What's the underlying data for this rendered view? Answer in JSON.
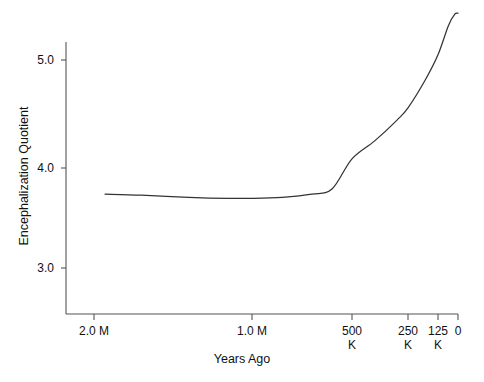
{
  "chart_data": {
    "type": "line",
    "title": "",
    "xlabel": "Years Ago",
    "ylabel": "Encephalization Quotient",
    "grid": false,
    "legend": "none",
    "x_axis": {
      "label": "Years Ago",
      "tick_labels": [
        "2.0 M",
        "1.0 M",
        "500\nK",
        "250\nK",
        "125\nK",
        "0"
      ],
      "tick_values_years_ago": [
        2000000,
        1000000,
        500000,
        250000,
        125000,
        0
      ],
      "tick_pixel_positions": [
        94,
        252,
        352,
        408,
        438,
        458
      ],
      "scale": "log-like (compressed toward present)",
      "direction": "decreasing left to right"
    },
    "y_axis": {
      "label": "Encephalization Quotient",
      "tick_labels": [
        "3.0",
        "4.0",
        "5.0"
      ],
      "tick_values": [
        3.0,
        4.0,
        5.0
      ],
      "ylim": [
        2.75,
        5.55
      ]
    },
    "series": [
      {
        "name": "Encephalization Quotient",
        "color": "#333333",
        "points": [
          {
            "years_ago": 1930000,
            "eq": 3.71
          },
          {
            "years_ago": 1700000,
            "eq": 3.7
          },
          {
            "years_ago": 1400000,
            "eq": 3.68
          },
          {
            "years_ago": 1150000,
            "eq": 3.67
          },
          {
            "years_ago": 1000000,
            "eq": 3.67
          },
          {
            "years_ago": 850000,
            "eq": 3.68
          },
          {
            "years_ago": 700000,
            "eq": 3.71
          },
          {
            "years_ago": 600000,
            "eq": 3.76
          },
          {
            "years_ago": 500000,
            "eq": 4.05
          },
          {
            "years_ago": 400000,
            "eq": 4.22
          },
          {
            "years_ago": 300000,
            "eq": 4.42
          },
          {
            "years_ago": 250000,
            "eq": 4.54
          },
          {
            "years_ago": 180000,
            "eq": 4.8
          },
          {
            "years_ago": 125000,
            "eq": 5.05
          },
          {
            "years_ago": 60000,
            "eq": 5.33
          },
          {
            "years_ago": 20000,
            "eq": 5.44
          },
          {
            "years_ago": 0,
            "eq": 5.45
          }
        ]
      }
    ],
    "x_tick_labels_line1": [
      "2.0 M",
      "1.0 M",
      "500",
      "250",
      "125",
      "0"
    ],
    "x_tick_labels_line2": [
      "",
      "",
      "K",
      "K",
      "K",
      ""
    ]
  },
  "axis_colors": {
    "axis_line": "#555555",
    "curve": "#3a3a3a",
    "text": "#111111",
    "background": "#ffffff"
  },
  "ticks": {
    "y": [
      {
        "label": "5.0",
        "y_px": 60
      },
      {
        "label": "4.0",
        "y_px": 168
      },
      {
        "label": "3.0",
        "y_px": 268
      }
    ],
    "x": [
      {
        "label_top": "2.0 M",
        "label_bottom": "",
        "x_px": 94
      },
      {
        "label_top": "1.0 M",
        "label_bottom": "",
        "x_px": 252
      },
      {
        "label_top": "500",
        "label_bottom": "K",
        "x_px": 352
      },
      {
        "label_top": "250",
        "label_bottom": "K",
        "x_px": 408
      },
      {
        "label_top": "125",
        "label_bottom": "K",
        "x_px": 438
      },
      {
        "label_top": "0",
        "label_bottom": "",
        "x_px": 458
      }
    ]
  }
}
